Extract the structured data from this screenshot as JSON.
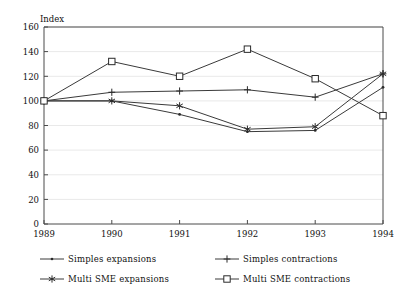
{
  "chart_data": {
    "type": "line",
    "title": "",
    "ylabel": "Index",
    "xlabel": "",
    "categories": [
      "1989",
      "1990",
      "1991",
      "1992",
      "1993",
      "1994"
    ],
    "x": [
      1989,
      1990,
      1991,
      1992,
      1993,
      1994
    ],
    "ylim": [
      0,
      160
    ],
    "y_ticks": [
      0,
      20,
      40,
      60,
      80,
      100,
      120,
      140,
      160
    ],
    "grid": true,
    "grid_axis": "y",
    "legend_position": "below",
    "series": [
      {
        "name": "Simples expansions",
        "marker": "dot",
        "values": [
          100,
          100,
          89,
          75,
          76,
          111
        ]
      },
      {
        "name": "Simples contractions",
        "marker": "plus",
        "values": [
          100,
          107,
          108,
          109,
          103,
          122
        ]
      },
      {
        "name": "Multi SME expansions",
        "marker": "star",
        "values": [
          100,
          100,
          96,
          77,
          79,
          122
        ]
      },
      {
        "name": "Multi SME contractions",
        "marker": "square",
        "values": [
          100,
          132,
          120,
          142,
          118,
          88
        ]
      }
    ]
  },
  "axis": {
    "y_label": "Index",
    "y_tick_labels": [
      "160",
      "140",
      "120",
      "100",
      "80",
      "60",
      "40",
      "20",
      "0"
    ],
    "x_tick_labels": [
      "1989",
      "1990",
      "1991",
      "1992",
      "1993",
      "1994"
    ]
  },
  "legend": {
    "entries": [
      {
        "label": "Simples expansions",
        "marker": "dot-marker"
      },
      {
        "label": "Simples contractions",
        "marker": "plus-marker"
      },
      {
        "label": "Multi SME expansions",
        "marker": "star-marker"
      },
      {
        "label": "Multi SME contractions",
        "marker": "square-marker"
      }
    ]
  },
  "colors": {
    "line": "#3a3a3a",
    "grid": "#e8e8e8",
    "axis": "#5a5a5a",
    "text": "#111111",
    "background": "#ffffff"
  }
}
